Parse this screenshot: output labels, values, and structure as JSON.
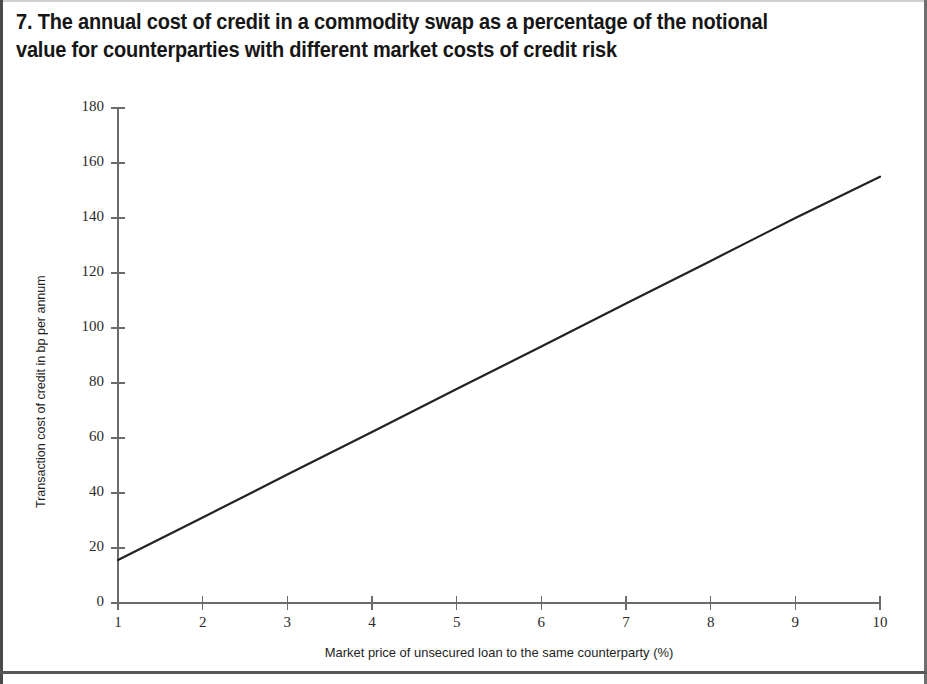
{
  "figure": {
    "number": "7.",
    "title": "7. The annual cost of credit in a commodity swap as a percentage of the notional\nvalue for counterparties with different market costs of credit risk",
    "line_color": "#222222",
    "axis_color": "#6b6b6b",
    "border_color": "#58585a",
    "background": "#ffffff"
  },
  "chart_data": {
    "type": "line",
    "title": "The annual cost of credit in a commodity swap as a percentage of the notional value for counterparties with different market costs of credit risk",
    "xlabel": "Market price of unsecured loan to the same counterparty (%)",
    "ylabel": "Transaction cost of credit in bp per annum",
    "xlim": [
      1,
      10
    ],
    "ylim": [
      0,
      180
    ],
    "grid": false,
    "legend": null,
    "x_ticks": [
      "1",
      "2",
      "3",
      "4",
      "5",
      "6",
      "7",
      "8",
      "9",
      "10"
    ],
    "y_ticks": [
      "0",
      "20",
      "40",
      "60",
      "80",
      "100",
      "120",
      "140",
      "160",
      "180"
    ],
    "x": [
      1,
      2,
      3,
      4,
      5,
      6,
      7,
      8,
      9,
      10
    ],
    "series": [
      {
        "name": "Transaction cost of credit",
        "values": [
          15.6,
          31.1,
          46.7,
          62.2,
          77.8,
          93.3,
          108.9,
          124.4,
          140.0,
          155.0
        ],
        "color": "#222222",
        "width": 2.2
      }
    ]
  }
}
